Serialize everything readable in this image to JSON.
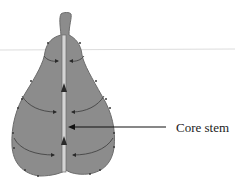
{
  "diagram": {
    "labels": {
      "core_stem": "Core stem"
    },
    "colors": {
      "fruit_fill": "#8a8a8a",
      "fruit_outline": "#6f6f6f",
      "core_fill": "#d6d6d6",
      "arrow": "#2a2a2a",
      "guide_line": "#d8d8d8"
    },
    "flow_arrows": {
      "upward_in_core": 2,
      "inward_curved_pairs": 3
    }
  }
}
